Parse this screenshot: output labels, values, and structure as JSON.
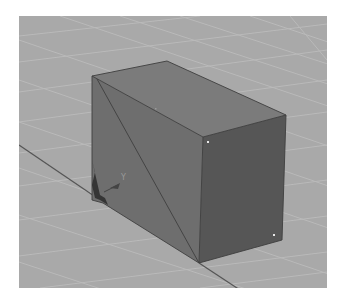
{
  "viewport": {
    "name": "3D perspective viewport",
    "background_color": "#a9a9a9",
    "grid_line_color": "#bdbdbd",
    "axis_line_color": "#4a4a4a"
  },
  "object": {
    "type": "box",
    "top_face_color": "#7b7b7b",
    "left_face_color": "#6e6e6e",
    "front_face_color": "#565656",
    "edge_color": "#3e3e3e",
    "vertex_color": "#e8e8e8"
  },
  "gizmo": {
    "axis_label": "Y"
  }
}
